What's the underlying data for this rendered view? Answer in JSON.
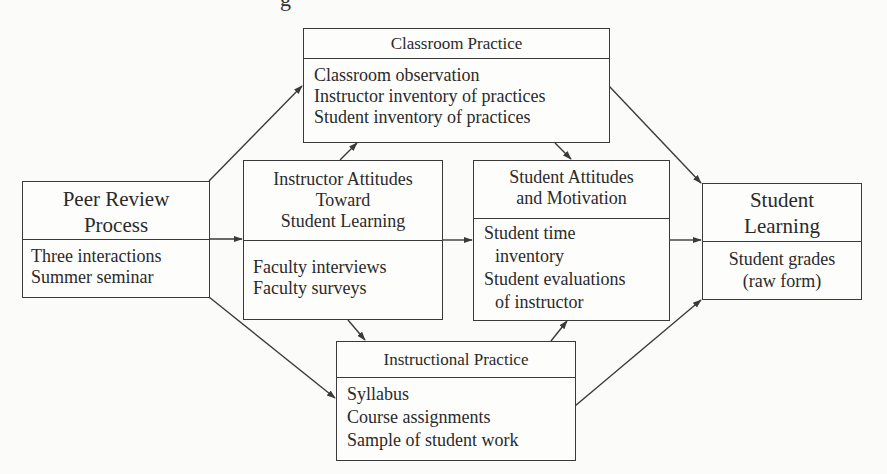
{
  "diagram": {
    "partial_title_visible": "g",
    "nodes": {
      "peer_review": {
        "title_lines": [
          "Peer Review",
          "Process"
        ],
        "items": [
          "Three interactions",
          "Summer seminar"
        ]
      },
      "classroom_practice": {
        "title_lines": [
          "Classroom Practice"
        ],
        "items": [
          "Classroom observation",
          "Instructor inventory of practices",
          "Student inventory of practices"
        ]
      },
      "instructor_attitudes": {
        "title_lines": [
          "Instructor Attitudes",
          "Toward",
          "Student Learning"
        ],
        "items": [
          "Faculty interviews",
          "Faculty surveys"
        ]
      },
      "student_attitudes": {
        "title_lines": [
          "Student Attitudes",
          "and Motivation"
        ],
        "items": [
          "Student time",
          "inventory",
          "Student evaluations",
          "of instructor"
        ]
      },
      "instructional_practice": {
        "title_lines": [
          "Instructional Practice"
        ],
        "items": [
          "Syllabus",
          "Course assignments",
          "Sample of student work"
        ]
      },
      "student_learning": {
        "title_lines": [
          "Student",
          "Learning"
        ],
        "items": [
          "Student grades",
          "(raw form)"
        ]
      }
    },
    "edges": [
      {
        "from": "Peer Review Process",
        "to": "Classroom Practice"
      },
      {
        "from": "Peer Review Process",
        "to": "Instructor Attitudes Toward Student Learning"
      },
      {
        "from": "Peer Review Process",
        "to": "Instructional Practice"
      },
      {
        "from": "Instructor Attitudes Toward Student Learning",
        "to": "Classroom Practice"
      },
      {
        "from": "Instructor Attitudes Toward Student Learning",
        "to": "Student Attitudes and Motivation"
      },
      {
        "from": "Instructor Attitudes Toward Student Learning",
        "to": "Instructional Practice"
      },
      {
        "from": "Classroom Practice",
        "to": "Student Attitudes and Motivation"
      },
      {
        "from": "Classroom Practice",
        "to": "Student Learning"
      },
      {
        "from": "Instructional Practice",
        "to": "Student Attitudes and Motivation"
      },
      {
        "from": "Instructional Practice",
        "to": "Student Learning"
      },
      {
        "from": "Student Attitudes and Motivation",
        "to": "Student Learning"
      }
    ],
    "colors": {
      "line": "#3a3a3a",
      "background": "#fbfbfa",
      "text": "#2a2a2a"
    }
  }
}
